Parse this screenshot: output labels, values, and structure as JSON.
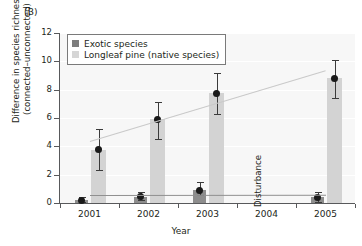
{
  "panel": {
    "label": "(B)"
  },
  "chart_data": {
    "type": "bar",
    "title": "",
    "subtitle": "",
    "xlabel": "Year",
    "ylabel": "Difference in species richness\n(connected–unconnected)",
    "ylabel_line1": "Difference in species richness",
    "ylabel_line2": "(connected–unconnected)",
    "categories": [
      "2001",
      "2002",
      "2003",
      "2004",
      "2005"
    ],
    "ylim": [
      0,
      12
    ],
    "yticks": [
      0,
      2,
      4,
      6,
      8,
      10,
      12
    ],
    "ytick_labels": [
      "0",
      "2",
      "4",
      "6",
      "8",
      "10",
      "12"
    ],
    "grid": true,
    "grid_axis": "y",
    "legend_position": "top-left",
    "series": [
      {
        "name": "Exotic species",
        "color": "#8d8d8d",
        "values": [
          0.18,
          0.45,
          0.9,
          null,
          0.4
        ],
        "errors_low": [
          0.05,
          0.18,
          0.55,
          null,
          0.1
        ],
        "errors_high": [
          0.45,
          0.8,
          1.45,
          null,
          0.8
        ],
        "points": [
          0.18,
          0.45,
          0.9,
          null,
          0.4
        ]
      },
      {
        "name": "Longleaf pine (native species)",
        "color": "#d3d3d3",
        "values": [
          3.75,
          5.9,
          7.75,
          null,
          8.8
        ],
        "errors_low": [
          2.3,
          4.5,
          6.3,
          null,
          7.4
        ],
        "errors_high": [
          5.2,
          7.15,
          9.2,
          null,
          10.1
        ],
        "points": [
          3.75,
          5.9,
          7.75,
          null,
          8.8
        ]
      }
    ],
    "trendlines": [
      {
        "name": "Longleaf pine trend",
        "color": "#c9c9c9",
        "x_start": "2001",
        "y_start": 4.35,
        "x_end": "2005",
        "y_end": 9.35
      },
      {
        "name": "Exotic species trend",
        "color": "#909090",
        "x_start": "2001",
        "y_start": 0.58,
        "x_end": "2005",
        "y_end": 0.6
      }
    ],
    "annotations": [
      {
        "text": "Disturbance",
        "x": "2004",
        "rotation": -90
      }
    ]
  },
  "legend": {
    "items": [
      {
        "label": "Exotic species",
        "color": "#8d8d8d"
      },
      {
        "label": "Longleaf pine (native species)",
        "color": "#d3d3d3"
      }
    ]
  }
}
